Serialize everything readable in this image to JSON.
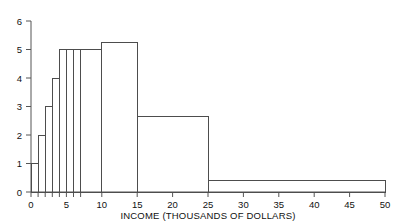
{
  "chart_data": {
    "type": "bar",
    "title": "",
    "subtitle": "",
    "xlabel": "INCOME (THOUSANDS OF DOLLARS)",
    "ylabel": "",
    "xlim": [
      0,
      50
    ],
    "ylim": [
      0,
      6
    ],
    "grid": false,
    "legend": null,
    "note": "Density histogram with unequal bin widths; bar height is density, area is proportion.",
    "bins": [
      {
        "label": "0-1",
        "x0": 0,
        "x1": 1,
        "height": 1.0
      },
      {
        "label": "1-2",
        "x0": 1,
        "x1": 2,
        "height": 2.0
      },
      {
        "label": "2-3",
        "x0": 2,
        "x1": 3,
        "height": 3.0
      },
      {
        "label": "3-4",
        "x0": 3,
        "x1": 4,
        "height": 4.0
      },
      {
        "label": "4-5",
        "x0": 4,
        "x1": 5,
        "height": 5.0
      },
      {
        "label": "5-6",
        "x0": 5,
        "x1": 6,
        "height": 5.0
      },
      {
        "label": "6-7",
        "x0": 6,
        "x1": 7,
        "height": 5.0
      },
      {
        "label": "7-10",
        "x0": 7,
        "x1": 10,
        "height": 5.0
      },
      {
        "label": "10-15",
        "x0": 10,
        "x1": 15,
        "height": 5.25
      },
      {
        "label": "15-25",
        "x0": 15,
        "x1": 25,
        "height": 2.65
      },
      {
        "label": "25-50",
        "x0": 25,
        "x1": 50,
        "height": 0.4
      }
    ],
    "x_ticks_major": [
      0,
      5,
      10,
      15,
      20,
      25,
      30,
      35,
      40,
      45,
      50
    ],
    "x_ticks_minor": [
      1,
      2,
      3,
      4,
      6,
      7
    ],
    "y_ticks": [
      0,
      1,
      2,
      3,
      4,
      5,
      6
    ],
    "x_tick_labels": [
      "0",
      "5",
      "10",
      "15",
      "20",
      "25",
      "30",
      "35",
      "40",
      "45",
      "50"
    ],
    "y_tick_labels": [
      "0",
      "1",
      "2",
      "3",
      "4",
      "5",
      "6"
    ],
    "colors": {
      "bar_stroke": "#4d4d4d",
      "axis": "#555555",
      "text": "#111111",
      "background": "#ffffff",
      "bar_fill": "none"
    }
  }
}
